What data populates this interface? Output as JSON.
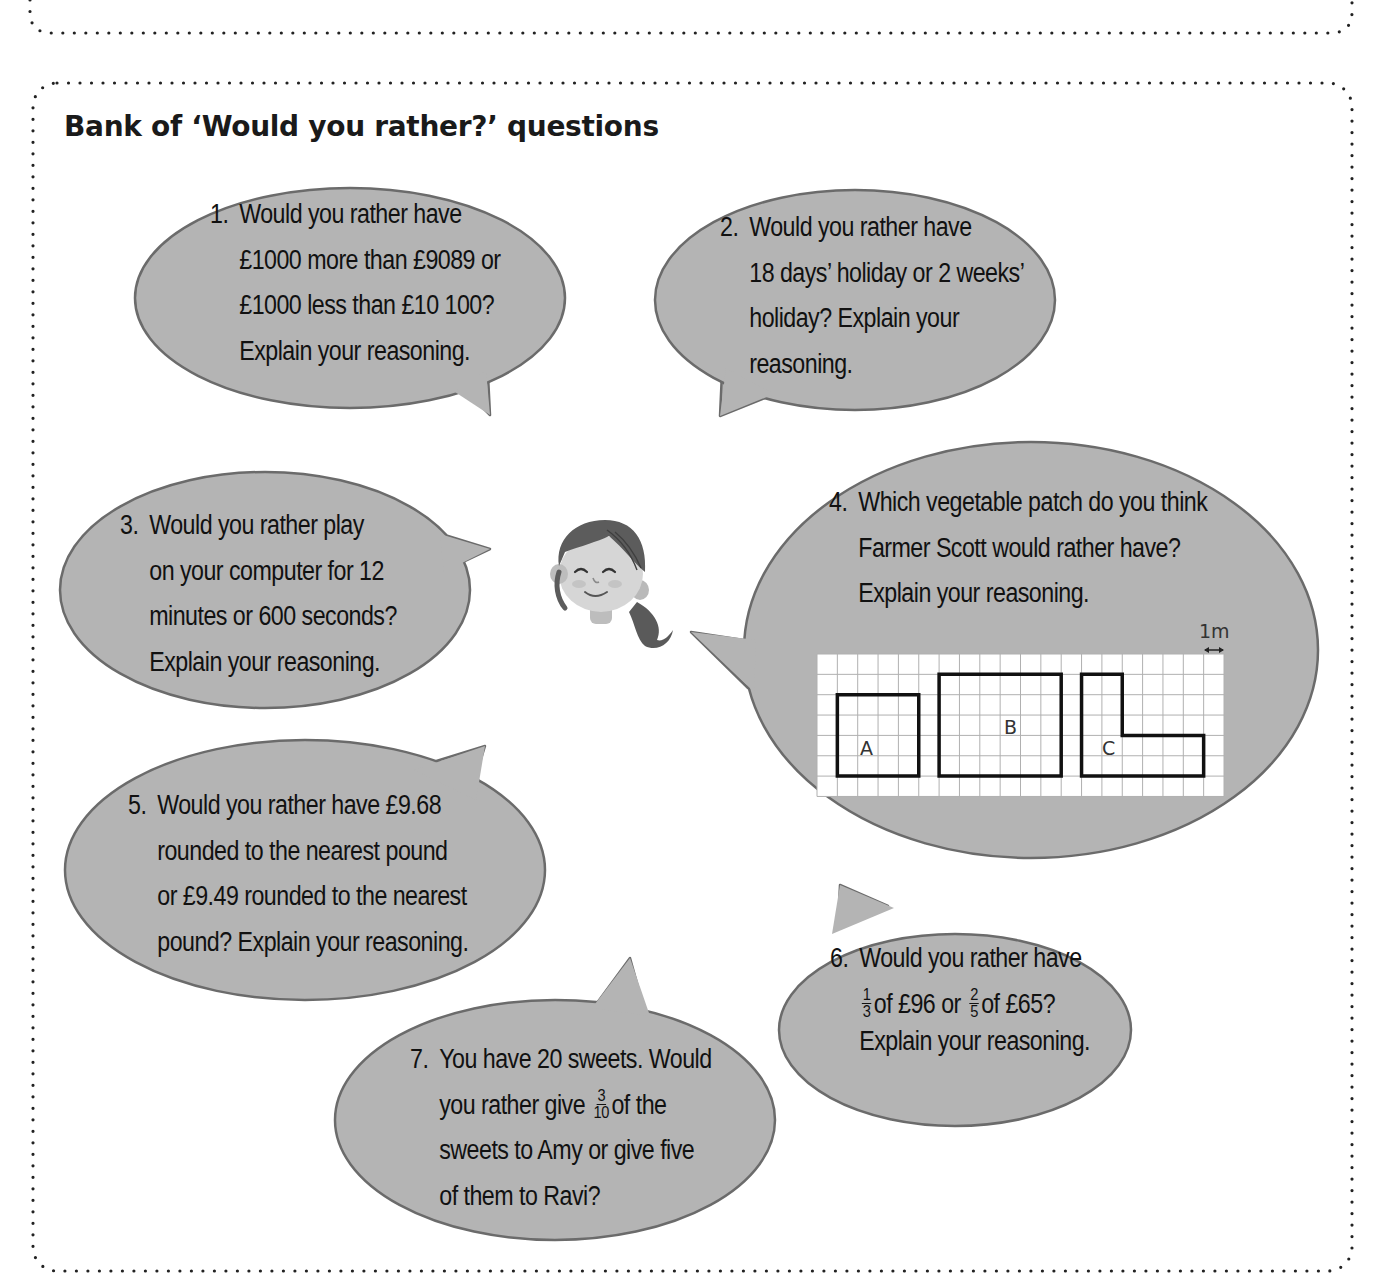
{
  "section": {
    "title": "Bank of ‘Would you rather?’ questions"
  },
  "colors": {
    "bubble_fill": "#b4b4b4",
    "bubble_stroke": "#6b6b6b",
    "text": "#111111",
    "border_dots": "#222222"
  },
  "questions": [
    {
      "number": "1.",
      "lines": [
        "Would you rather have",
        "£1000 more than £9089 or",
        "£1000 less than £10 100?",
        "Explain your reasoning."
      ]
    },
    {
      "number": "2.",
      "lines": [
        "Would you rather have",
        "18 days’ holiday or 2 weeks’",
        "holiday? Explain your",
        "reasoning."
      ]
    },
    {
      "number": "3.",
      "lines": [
        "Would you rather play",
        "on your computer for 12",
        "minutes or 600 seconds?",
        "Explain your reasoning."
      ]
    },
    {
      "number": "4.",
      "lines": [
        "Which vegetable patch do you think",
        "Farmer Scott would rather have?",
        "Explain your reasoning."
      ],
      "diagram": {
        "scale_label": "1m",
        "grid_columns": 20,
        "grid_rows": 7,
        "shapes": [
          {
            "label": "A",
            "cells_area": 16
          },
          {
            "label": "B",
            "cells_area": 30
          },
          {
            "label": "C",
            "cells_area": 18
          }
        ]
      }
    },
    {
      "number": "5.",
      "lines": [
        "Would you rather have £9.68",
        "rounded to the nearest pound",
        "or £9.49 rounded to the nearest",
        "pound? Explain your reasoning."
      ]
    },
    {
      "number": "6.",
      "line1": "Would you rather have",
      "frac1": {
        "num": "1",
        "den": "3"
      },
      "mid1": "of £96 or",
      "frac2": {
        "num": "2",
        "den": "5"
      },
      "mid2": "of £65?",
      "line3": "Explain your reasoning."
    },
    {
      "number": "7.",
      "line1": "You have 20 sweets. Would",
      "pre2": "you rather give",
      "frac": {
        "num": "3",
        "den": "10"
      },
      "post2": "of the",
      "line3": "sweets to Amy or give five",
      "line4": "of them to Ravi?"
    }
  ],
  "character": {
    "icon": "girl-face-icon"
  }
}
